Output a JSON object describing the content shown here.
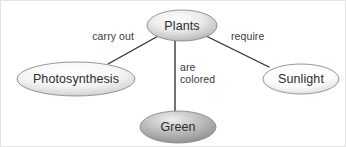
{
  "diagram": {
    "type": "concept-map",
    "background_color": "#ffffff",
    "border_color": "#e3e3e3",
    "line_color": "#2f2f2f",
    "text_color": "#2b2b2b",
    "edge_label_color": "#3a3a3a",
    "nodes": [
      {
        "id": "plants",
        "label": "Plants",
        "shape": "ellipse",
        "cx": 181,
        "cy": 24.5,
        "rx": 35,
        "ry": 15.5,
        "fill_light": "#fbfbfb",
        "fill_mid": "#e4e4e4",
        "fill_dark": "#b4b4b4",
        "stroke": "#8a8a8a"
      },
      {
        "id": "photosynthesis",
        "label": "Photosynthesis",
        "shape": "ellipse",
        "cx": 75,
        "cy": 78,
        "rx": 59,
        "ry": 17,
        "fill_light": "#ffffff",
        "fill_mid": "#f1f1f1",
        "fill_dark": "#cfcfcf",
        "stroke": "#9a9a9a"
      },
      {
        "id": "sunlight",
        "label": "Sunlight",
        "shape": "ellipse",
        "cx": 300,
        "cy": 78,
        "rx": 38,
        "ry": 15,
        "fill_light": "#ffffff",
        "fill_mid": "#f8f8f8",
        "fill_dark": "#dcdcdc",
        "stroke": "#a8a8a8"
      },
      {
        "id": "green",
        "label": "Green",
        "shape": "ellipse",
        "cx": 177,
        "cy": 126,
        "rx": 38,
        "ry": 16,
        "fill_light": "#e8e8e8",
        "fill_mid": "#bcbcbc",
        "fill_dark": "#8f8f8f",
        "stroke": "#6f6f6f"
      }
    ],
    "edges": [
      {
        "id": "plants-photosynthesis",
        "from": "plants",
        "to": "photosynthesis",
        "label": "carry out",
        "label_x": 133,
        "label_y": 39,
        "x1": 159,
        "y1": 34,
        "x2": 107,
        "y2": 63
      },
      {
        "id": "plants-green",
        "from": "plants",
        "to": "green",
        "label_line1": "are",
        "label_line2": "colored",
        "label_x": 179,
        "label_y": 73,
        "x1": 174,
        "y1": 40,
        "x2": 174,
        "y2": 111
      },
      {
        "id": "plants-sunlight",
        "from": "plants",
        "to": "sunlight",
        "label": "require",
        "label_x": 230,
        "label_y": 39,
        "x1": 203,
        "y1": 34,
        "x2": 268,
        "y2": 66
      }
    ]
  }
}
